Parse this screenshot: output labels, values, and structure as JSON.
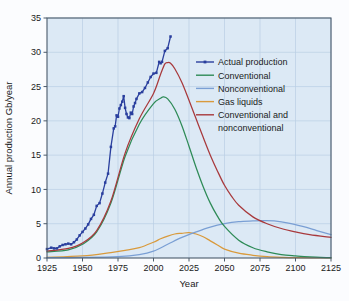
{
  "chart_data": {
    "type": "line",
    "title": "",
    "xlabel": "Year",
    "ylabel": "Annual production Gb/year",
    "xlim": [
      1925,
      2125
    ],
    "ylim": [
      0,
      35
    ],
    "xticks": [
      1925,
      1950,
      1975,
      2000,
      2025,
      2050,
      2075,
      2100,
      2125
    ],
    "yticks": [
      0,
      5,
      10,
      15,
      20,
      25,
      30,
      35
    ],
    "grid": true,
    "legend_position": "upper-right",
    "colors": {
      "actual_production": "#2a3f9e",
      "conventional": "#2e8b57",
      "nonconventional": "#7a9fd4",
      "gas_liquids": "#d99a3c",
      "conventional_and_nonconventional": "#a8393c",
      "plot_background": "#dce9f5",
      "grid_line": "#b9cfe4",
      "axis": "#4a5a6a",
      "page_background": "#fbfcfe"
    },
    "series": [
      {
        "name": "Actual production",
        "color": "#2a3f9e",
        "marker": "square",
        "x": [
          1925,
          1928,
          1930,
          1932,
          1934,
          1936,
          1938,
          1940,
          1942,
          1944,
          1946,
          1948,
          1950,
          1952,
          1954,
          1956,
          1958,
          1960,
          1962,
          1964,
          1966,
          1968,
          1970,
          1972,
          1973,
          1974,
          1975,
          1976,
          1977,
          1978,
          1979,
          1980,
          1981,
          1982,
          1983,
          1984,
          1985,
          1986,
          1987,
          1988,
          1990,
          1992,
          1994,
          1996,
          1998,
          2000,
          2002,
          2004,
          2005,
          2006,
          2008,
          2010,
          2012
        ],
        "values": [
          1.3,
          1.5,
          1.4,
          1.4,
          1.7,
          1.9,
          2.0,
          2.1,
          2.0,
          2.3,
          2.7,
          3.3,
          3.8,
          4.3,
          4.9,
          5.7,
          6.3,
          7.6,
          8.0,
          9.4,
          11.0,
          12.3,
          16.2,
          18.9,
          19.2,
          20.8,
          20.6,
          21.8,
          22.3,
          22.8,
          23.6,
          21.9,
          21.0,
          20.5,
          20.4,
          21.2,
          21.0,
          22.1,
          22.6,
          23.2,
          24.0,
          24.2,
          24.8,
          25.6,
          26.4,
          26.9,
          27.0,
          28.6,
          28.4,
          28.6,
          30.2,
          30.6,
          32.3
        ]
      },
      {
        "name": "Conventional",
        "color": "#2e8b57",
        "x": [
          1925,
          1940,
          1950,
          1960,
          1970,
          1980,
          1990,
          2000,
          2005,
          2007,
          2010,
          2015,
          2020,
          2025,
          2030,
          2035,
          2040,
          2045,
          2050,
          2060,
          2070,
          2080,
          2090,
          2100,
          2110,
          2125
        ],
        "values": [
          0.9,
          1.2,
          2.0,
          3.8,
          8.0,
          14.8,
          19.5,
          22.5,
          23.3,
          23.5,
          23.2,
          21.7,
          19.3,
          16.3,
          13.2,
          10.4,
          8.0,
          6.1,
          4.6,
          2.6,
          1.5,
          0.9,
          0.5,
          0.3,
          0.15,
          0.05
        ]
      },
      {
        "name": "Nonconventional",
        "color": "#7a9fd4",
        "x": [
          1925,
          1950,
          1975,
          1990,
          2000,
          2010,
          2020,
          2030,
          2040,
          2050,
          2060,
          2070,
          2078,
          2085,
          2095,
          2105,
          2115,
          2125
        ],
        "values": [
          0.05,
          0.08,
          0.2,
          0.5,
          1.0,
          2.0,
          3.0,
          3.8,
          4.5,
          5.0,
          5.3,
          5.4,
          5.45,
          5.4,
          5.1,
          4.6,
          4.0,
          3.4
        ]
      },
      {
        "name": "Gas liquids",
        "color": "#d99a3c",
        "x": [
          1925,
          1950,
          1970,
          1980,
          1990,
          2000,
          2005,
          2010,
          2015,
          2020,
          2025,
          2030,
          2035,
          2040,
          2045,
          2050,
          2060,
          2070,
          2080,
          2090,
          2100,
          2125
        ],
        "values": [
          0.1,
          0.3,
          0.8,
          1.1,
          1.5,
          2.3,
          2.8,
          3.2,
          3.5,
          3.6,
          3.7,
          3.5,
          3.1,
          2.5,
          1.9,
          1.3,
          0.7,
          0.4,
          0.2,
          0.1,
          0.05,
          0.02
        ]
      },
      {
        "name": "Conventional and nonconventional",
        "color": "#a8393c",
        "x": [
          1925,
          1940,
          1950,
          1960,
          1970,
          1980,
          1990,
          2000,
          2005,
          2008,
          2010,
          2012,
          2015,
          2020,
          2025,
          2030,
          2035,
          2040,
          2045,
          2050,
          2055,
          2060,
          2070,
          2080,
          2090,
          2100,
          2110,
          2125
        ],
        "values": [
          1.0,
          1.4,
          2.2,
          4.0,
          8.3,
          15.3,
          20.3,
          24.0,
          26.8,
          28.3,
          28.5,
          28.4,
          27.6,
          25.6,
          23.0,
          20.3,
          17.6,
          15.0,
          12.7,
          10.6,
          9.0,
          7.7,
          6.0,
          5.0,
          4.3,
          3.8,
          3.4,
          3.0
        ]
      }
    ],
    "legend": [
      {
        "label": "Actual production",
        "color": "#2a3f9e",
        "marker": true
      },
      {
        "label": "Conventional",
        "color": "#2e8b57",
        "marker": false
      },
      {
        "label": "Nonconventional",
        "color": "#7a9fd4",
        "marker": false
      },
      {
        "label": "Gas liquids",
        "color": "#d99a3c",
        "marker": false
      },
      {
        "label": "Conventional and",
        "label2": "nonconventional",
        "color": "#a8393c",
        "marker": false
      }
    ]
  }
}
